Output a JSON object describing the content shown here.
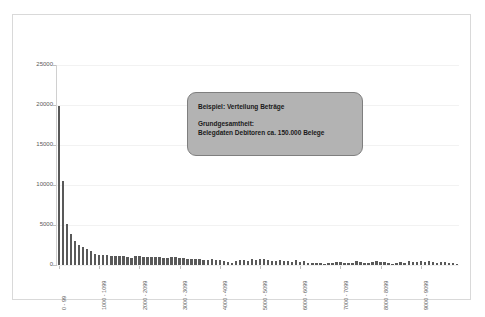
{
  "callout": {
    "line1": "Beispiel: Verteilung Beträge",
    "line2": "Grundgesamtheit:",
    "line3": "Belegdaten Debitoren ca. 150.000 Belege"
  },
  "colors": {
    "bar": "#595959",
    "callout_fill": "#b3b3b3",
    "callout_border": "#7f7f7f",
    "frame_border": "#d9d9d9",
    "gridline": "#f2f2f2",
    "axis_text": "#595959"
  },
  "chart_data": {
    "type": "bar",
    "title": "",
    "xlabel": "",
    "ylabel": "",
    "ylim": [
      0,
      25000
    ],
    "grid": true,
    "legend": "none",
    "ytick_labels": [
      "0",
      "5000",
      "10000",
      "15000",
      "20000",
      "25000"
    ],
    "ytick_values": [
      0,
      5000,
      10000,
      15000,
      20000,
      25000
    ],
    "xtick_labels": [
      "0 - 99",
      "1000 - 1099",
      "2000 - 2099",
      "3000 - 3099",
      "4000 - 4099",
      "5000 - 5099",
      "6000 - 6099",
      "7000 - 7099",
      "8000 - 8099",
      "9000 - 9099"
    ],
    "xtick_indices": [
      0,
      10,
      20,
      30,
      40,
      50,
      60,
      70,
      80,
      90
    ],
    "categories": [
      "0 - 99",
      "100 - 199",
      "200 - 299",
      "300 - 399",
      "400 - 499",
      "500 - 599",
      "600 - 699",
      "700 - 799",
      "800 - 899",
      "900 - 999",
      "1000 - 1099",
      "1100 - 1199",
      "1200 - 1299",
      "1300 - 1399",
      "1400 - 1499",
      "1500 - 1599",
      "1600 - 1699",
      "1700 - 1799",
      "1800 - 1899",
      "1900 - 1999",
      "2000 - 2099",
      "2100 - 2199",
      "2200 - 2299",
      "2300 - 2399",
      "2400 - 2499",
      "2500 - 2599",
      "2600 - 2699",
      "2700 - 2799",
      "2800 - 2899",
      "2900 - 2999",
      "3000 - 3099",
      "3100 - 3199",
      "3200 - 3299",
      "3300 - 3399",
      "3400 - 3499",
      "3500 - 3599",
      "3600 - 3699",
      "3700 - 3799",
      "3800 - 3899",
      "3900 - 3999",
      "4000 - 4099",
      "4100 - 4199",
      "4200 - 4299",
      "4300 - 4399",
      "4400 - 4499",
      "4500 - 4599",
      "4600 - 4699",
      "4700 - 4799",
      "4800 - 4899",
      "4900 - 4999",
      "5000 - 5099",
      "5100 - 5199",
      "5200 - 5299",
      "5300 - 5399",
      "5400 - 5499",
      "5500 - 5599",
      "5600 - 5699",
      "5700 - 5799",
      "5800 - 5899",
      "5900 - 5999",
      "6000 - 6099",
      "6100 - 6199",
      "6200 - 6299",
      "6300 - 6399",
      "6400 - 6499",
      "6500 - 6599",
      "6600 - 6699",
      "6700 - 6799",
      "6800 - 6899",
      "6900 - 6999",
      "7000 - 7099",
      "7100 - 7199",
      "7200 - 7299",
      "7300 - 7399",
      "7400 - 7499",
      "7500 - 7599",
      "7600 - 7699",
      "7700 - 7799",
      "7800 - 7899",
      "7900 - 7999",
      "8000 - 8099",
      "8100 - 8199",
      "8200 - 8299",
      "8300 - 8399",
      "8400 - 8499",
      "8500 - 8599",
      "8600 - 8699",
      "8700 - 8799",
      "8800 - 8899",
      "8900 - 8999",
      "9000 - 9099",
      "9100 - 9199",
      "9200 - 9299",
      "9300 - 9399",
      "9400 - 9499",
      "9500 - 9599",
      "9600 - 9699",
      "9700 - 9799",
      "9800 - 9899",
      "9900 - 9999"
    ],
    "values": [
      19900,
      10450,
      5150,
      3900,
      3000,
      2550,
      2250,
      2050,
      1700,
      1400,
      1250,
      1200,
      1200,
      1150,
      1100,
      1150,
      1100,
      1000,
      900,
      1150,
      1100,
      1000,
      1050,
      1000,
      1000,
      950,
      900,
      850,
      1000,
      1050,
      900,
      850,
      750,
      700,
      800,
      700,
      650,
      600,
      700,
      600,
      600,
      500,
      400,
      300,
      550,
      650,
      600,
      550,
      700,
      600,
      750,
      700,
      600,
      550,
      500,
      600,
      550,
      500,
      350,
      600,
      400,
      450,
      300,
      250,
      200,
      200,
      150,
      300,
      250,
      350,
      400,
      300,
      250,
      200,
      450,
      350,
      300,
      200,
      400,
      450,
      400,
      350,
      250,
      150,
      200,
      400,
      300,
      450,
      400,
      350,
      500,
      400,
      450,
      350,
      300,
      400,
      350,
      250,
      200,
      150
    ]
  }
}
